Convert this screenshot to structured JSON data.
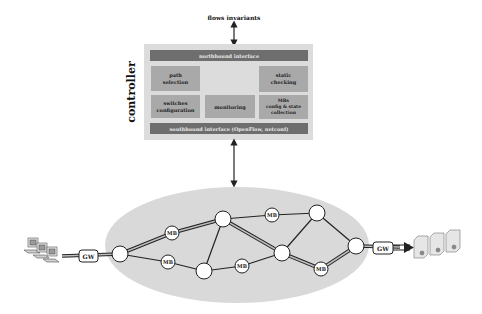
{
  "diagram": {
    "top_label": "flows invariants",
    "controller_label": "controller",
    "northbound": "northbound interface",
    "southbound": "southbound interface (OpenFlow, netconf)",
    "modules": {
      "path_selection": [
        "path",
        "selection"
      ],
      "static_checking": [
        "static",
        "checking"
      ],
      "switches_configuration": [
        "switches",
        "configuration"
      ],
      "monitoring": [
        "monitoring"
      ],
      "mbs_config": [
        "MBs",
        "config & state",
        "collection"
      ]
    },
    "network": {
      "gateway_left": "GW",
      "gateway_right": "GW",
      "middlebox_label": "MB"
    },
    "colors": {
      "bar": "#6e6e6e",
      "module": "#a9a9a9",
      "controller_bg": "#dcdcdc",
      "network_cloud": "#d9d9d9"
    }
  }
}
